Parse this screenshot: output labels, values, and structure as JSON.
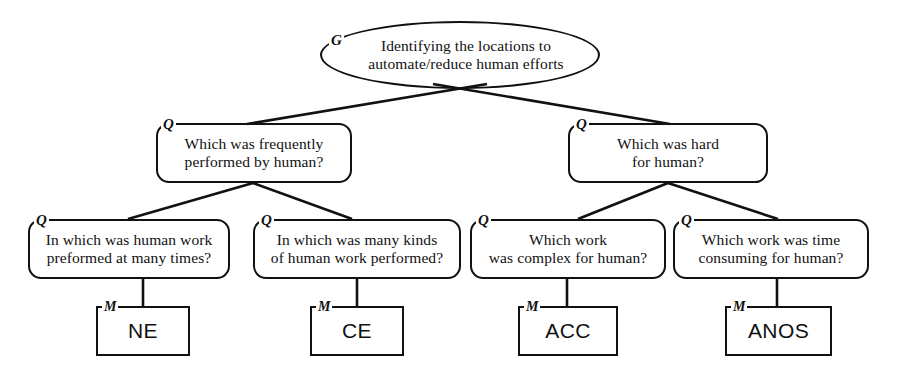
{
  "diagram": {
    "type": "gqm-tree",
    "title_text": "",
    "stroke_color": "#111111",
    "background_color": "#ffffff",
    "nodes": {
      "goal": {
        "tag": "G",
        "shape": "ellipse",
        "line1": "Identifying the locations to",
        "line2": "automate/reduce human efforts"
      },
      "q_left": {
        "tag": "Q",
        "shape": "rounded-rect",
        "line1": "Which was frequently",
        "line2": "performed by human?"
      },
      "q_right": {
        "tag": "Q",
        "shape": "rounded-rect",
        "line1": "Which was hard",
        "line2": "for human?"
      },
      "q_1": {
        "tag": "Q",
        "shape": "rounded-rect",
        "line1": "In which was human work",
        "line2": "preformed at many times?"
      },
      "q_2": {
        "tag": "Q",
        "shape": "rounded-rect",
        "line1": "In which was many kinds",
        "line2": "of human work performed?"
      },
      "q_3": {
        "tag": "Q",
        "shape": "rounded-rect",
        "line1": "Which work",
        "line2": "was complex for human?"
      },
      "q_4": {
        "tag": "Q",
        "shape": "rounded-rect",
        "line1": "Which work was time",
        "line2": "consuming for human?"
      },
      "m_1": {
        "tag": "M",
        "shape": "rect",
        "label": "NE"
      },
      "m_2": {
        "tag": "M",
        "shape": "rect",
        "label": "CE"
      },
      "m_3": {
        "tag": "M",
        "shape": "rect",
        "label": "ACC"
      },
      "m_4": {
        "tag": "M",
        "shape": "rect",
        "label": "ANOS"
      }
    }
  }
}
